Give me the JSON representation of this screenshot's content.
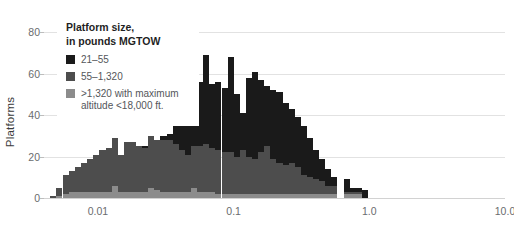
{
  "chart_data": {
    "type": "bar",
    "title": "",
    "xlabel": "",
    "ylabel": "Platforms",
    "stacked": true,
    "xscale": "log",
    "xlim": [
      0.004,
      10.0
    ],
    "ylim": [
      0,
      85
    ],
    "yticks": [
      0,
      20,
      40,
      60,
      80
    ],
    "ytick_labels": [
      "0",
      "20",
      "40",
      "60",
      "80"
    ],
    "xticks": [
      0.01,
      0.1,
      1.0,
      10.0
    ],
    "xtick_labels": [
      "0.01",
      "0.1",
      "1.0",
      "10.0"
    ],
    "grid": "horizontal",
    "legend_position": "top-left",
    "series": [
      {
        "name": "21-55",
        "color": "#1a1a1a",
        "values": [
          0,
          0,
          0,
          0,
          0,
          0,
          0,
          0,
          0,
          0,
          0,
          0,
          0,
          0,
          0,
          1,
          0,
          0,
          2,
          3,
          26,
          27,
          28,
          30,
          31,
          43,
          31,
          33,
          31,
          46,
          30,
          18,
          38,
          42,
          35,
          29,
          33,
          34,
          30,
          26,
          24,
          24,
          19,
          14,
          11,
          8,
          4,
          0,
          6,
          2,
          2,
          4
        ]
      },
      {
        "name": "55-1,320",
        "color": "#4d4d4d",
        "values": [
          1,
          4,
          9,
          10,
          12,
          14,
          16,
          18,
          20,
          21,
          23,
          18,
          24,
          24,
          22,
          21,
          25,
          24,
          25,
          25,
          23,
          20,
          18,
          20,
          22,
          23,
          21,
          21,
          20,
          20,
          18,
          21,
          18,
          17,
          20,
          23,
          17,
          15,
          14,
          15,
          13,
          9,
          8,
          7,
          6,
          4,
          4,
          0,
          1,
          1,
          1,
          0
        ]
      },
      {
        "name": ">1,320 with maximum altitude <18,000 ft.",
        "color": "#8c8c8c",
        "values": [
          0,
          1,
          2,
          3,
          3,
          3,
          3,
          3,
          3,
          3,
          6,
          3,
          3,
          3,
          3,
          3,
          5,
          4,
          3,
          3,
          3,
          3,
          3,
          5,
          3,
          3,
          3,
          2,
          2,
          2,
          2,
          2,
          2,
          2,
          2,
          2,
          2,
          2,
          2,
          2,
          2,
          2,
          2,
          2,
          2,
          2,
          2,
          0,
          2,
          2,
          2,
          0
        ]
      }
    ],
    "bin_centers": [
      0.0047,
      0.0052,
      0.0058,
      0.0064,
      0.0071,
      0.0079,
      0.0088,
      0.0097,
      0.0108,
      0.012,
      0.0133,
      0.0147,
      0.0163,
      0.0181,
      0.0201,
      0.0223,
      0.0247,
      0.0274,
      0.0304,
      0.0337,
      0.0374,
      0.0415,
      0.046,
      0.051,
      0.0566,
      0.0628,
      0.0696,
      0.0772,
      0.0857,
      0.095,
      0.1054,
      0.1169,
      0.1296,
      0.1438,
      0.1595,
      0.1769,
      0.1962,
      0.2176,
      0.2414,
      0.2677,
      0.297,
      0.3294,
      0.3654,
      0.4052,
      0.4495,
      0.4985,
      0.5529,
      0.6133,
      0.6802,
      0.7544,
      0.8367,
      0.928
    ]
  },
  "axes": {
    "y_title": "Platforms"
  },
  "legend": {
    "title": "Platform size,\nin pounds MGTOW",
    "items": [
      {
        "label": "21–55",
        "color": "#1a1a1a"
      },
      {
        "label": "55–1,320",
        "color": "#4d4d4d"
      },
      {
        "label": ">1,320 with maximum\naltitude <18,000 ft.",
        "color": "#8c8c8c"
      }
    ]
  },
  "colors": {
    "background": "#ffffff",
    "gridline": "#e2e2e2",
    "baseline": "#d2d2d2",
    "tick_text": "#6a6c6e",
    "axis_title": "#3b3b3b"
  }
}
